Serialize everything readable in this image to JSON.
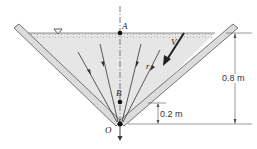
{
  "figure": {
    "type": "diagram",
    "points": {
      "A": "A",
      "B": "B",
      "O": "O"
    },
    "labels": {
      "velocity": "V",
      "radius": "r"
    },
    "dimensions": {
      "total_depth": "0.8 m",
      "b_height": "0.2 m"
    },
    "symbols": {
      "free_surface": "free-surface-triangle"
    },
    "colors": {
      "water": "#e4e4e4",
      "wall": "#d9d9d9",
      "wall_edge": "#555555",
      "line": "#333333"
    }
  }
}
